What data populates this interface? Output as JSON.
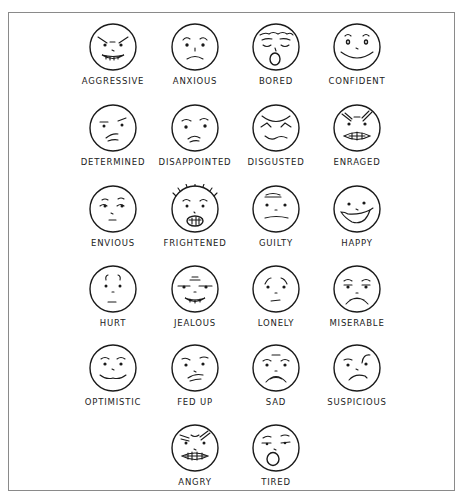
{
  "figure": {
    "border_color": "#8a8a8a",
    "ink_color": "#1a1a1a",
    "faces": [
      {
        "label": "AGGRESSIVE",
        "expression": "aggressive"
      },
      {
        "label": "ANXIOUS",
        "expression": "anxious"
      },
      {
        "label": "BORED",
        "expression": "bored"
      },
      {
        "label": "CONFIDENT",
        "expression": "confident"
      },
      {
        "label": "DETERMINED",
        "expression": "determined"
      },
      {
        "label": "DISAPPOINTED",
        "expression": "disappointed"
      },
      {
        "label": "DISGUSTED",
        "expression": "disgusted"
      },
      {
        "label": "ENRAGED",
        "expression": "enraged"
      },
      {
        "label": "ENVIOUS",
        "expression": "envious"
      },
      {
        "label": "FRIGHTENED",
        "expression": "frightened"
      },
      {
        "label": "GUILTY",
        "expression": "guilty"
      },
      {
        "label": "HAPPY",
        "expression": "happy"
      },
      {
        "label": "HURT",
        "expression": "hurt"
      },
      {
        "label": "JEALOUS",
        "expression": "jealous"
      },
      {
        "label": "LONELY",
        "expression": "lonely"
      },
      {
        "label": "MISERABLE",
        "expression": "miserable"
      },
      {
        "label": "OPTIMISTIC",
        "expression": "optimistic"
      },
      {
        "label": "FED UP",
        "expression": "fed-up"
      },
      {
        "label": "SAD",
        "expression": "sad"
      },
      {
        "label": "SUSPICIOUS",
        "expression": "suspicious"
      },
      {
        "label": "ANGRY",
        "expression": "angry"
      },
      {
        "label": "TIRED",
        "expression": "tired"
      }
    ]
  }
}
